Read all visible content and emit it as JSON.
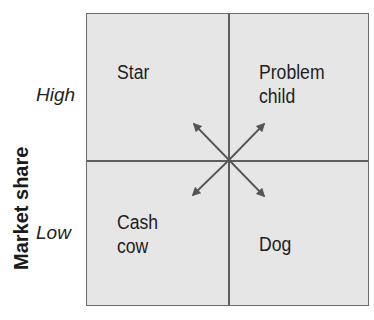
{
  "diagram": {
    "type": "bcg-growth-share-matrix",
    "y_axis": {
      "label": "Market share",
      "ticks": {
        "high": "High",
        "low": "Low"
      }
    },
    "quadrants": {
      "top_left": {
        "line1": "Star",
        "line2": ""
      },
      "top_right": {
        "line1": "Problem",
        "line2": "child"
      },
      "bottom_left": {
        "line1": "Cash",
        "line2": "cow"
      },
      "bottom_right": {
        "line1": "Dog",
        "line2": ""
      }
    },
    "arrows": [
      "up-left",
      "up-right",
      "down-left",
      "down-right"
    ],
    "colors": {
      "fill": "#e6e6e6",
      "lines": "#5e5e5e",
      "arrow": "#555555"
    }
  }
}
